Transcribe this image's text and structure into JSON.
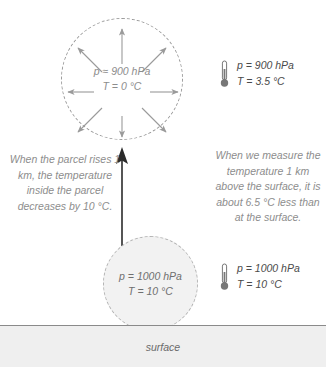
{
  "diagram": {
    "colors": {
      "parcel_outline": "#9a9a9a",
      "parcel_fill": "#f2f2f2",
      "arrow": "#8d8d8d",
      "rising_arrow": "#2b2b2b",
      "note_text": "#8d8d8d",
      "readout_text": "#4a4a4a",
      "surface_fill": "#efefef",
      "surface_line": "#8a8a8a"
    }
  },
  "parcel_upper": {
    "pressure": "p ≈ 900 hPa",
    "temperature": "T = 0 °C",
    "expansion_arrow_count": 8
  },
  "parcel_lower": {
    "pressure": "p = 1000 hPa",
    "temperature": "T = 10 °C"
  },
  "readout_upper": {
    "icon": "thermometer-icon",
    "pressure": "p = 900 hPa",
    "temperature": "T = 3.5 °C"
  },
  "readout_lower": {
    "icon": "thermometer-icon",
    "pressure": "p = 1000 hPa",
    "temperature": "T = 10 °C"
  },
  "note_left": {
    "text": "When the parcel rises 1 km, the temperature inside the parcel decreases by 10 °C."
  },
  "note_right": {
    "text": "When we measure the temperature 1 km above the surface, it is about 6.5 °C less than at the surface."
  },
  "rising_arrow": {
    "icon": "up-arrow-icon",
    "meaning": "parcel rises 1 km"
  },
  "surface": {
    "label": "surface"
  }
}
